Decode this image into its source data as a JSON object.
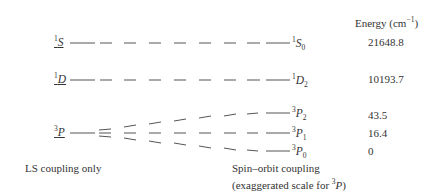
{
  "header": {
    "energy_label": "Energy (cm",
    "energy_unit_sup": "−1",
    "energy_close": ")"
  },
  "levels_ls": [
    {
      "term": "S",
      "multiplicity": "1"
    },
    {
      "term": "D",
      "multiplicity": "1"
    },
    {
      "term": "P",
      "multiplicity": "3"
    }
  ],
  "levels_so": [
    {
      "term": "S",
      "multiplicity": "1",
      "J": "0",
      "energy": "21648.8"
    },
    {
      "term": "D",
      "multiplicity": "1",
      "J": "2",
      "energy": "10193.7"
    },
    {
      "term": "P",
      "multiplicity": "3",
      "J": "2",
      "energy": "43.5"
    },
    {
      "term": "P",
      "multiplicity": "3",
      "J": "1",
      "energy": "16.4"
    },
    {
      "term": "P",
      "multiplicity": "3",
      "J": "0",
      "energy": "0"
    }
  ],
  "captions": {
    "left": "LS coupling only",
    "right_line1": "Spin–orbit coupling",
    "right_line2_pre": "(exaggerated scale for ",
    "right_line2_sup": "3",
    "right_line2_term": "P",
    "right_line2_post": ")"
  },
  "colors": {
    "line": "#555555",
    "text": "#333333"
  }
}
